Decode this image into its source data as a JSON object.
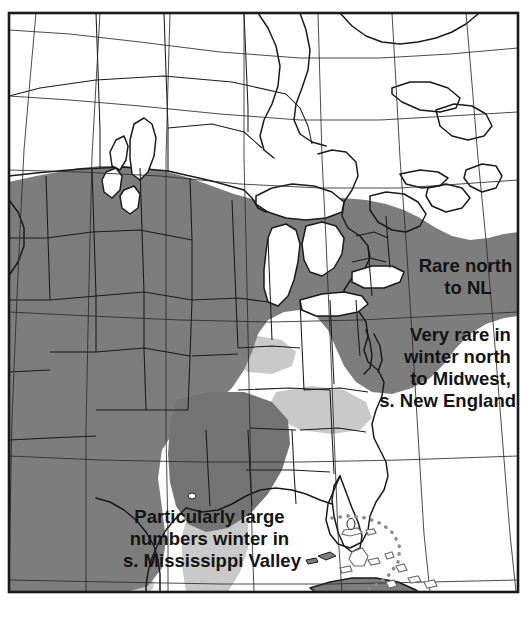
{
  "map": {
    "type": "species-winter-range-map",
    "frame": {
      "border_color": "#1a1a1a",
      "background_color": "#ffffff"
    },
    "legend_colors": {
      "core_range": "#7d7d7d",
      "secondary_range": "#8c8c8c",
      "peripheral_range": "#c9c9c9",
      "water": "#ffffff",
      "outline": "#1a1a1a",
      "text": "#141414"
    },
    "annotations": [
      {
        "id": "annotation-rare-north",
        "align": "middle",
        "x": 468,
        "y": 272,
        "lines": [
          "Rare north",
          "to NL"
        ]
      },
      {
        "id": "annotation-very-rare-winter",
        "align": "end",
        "x": 516,
        "y": 341,
        "lines": [
          "Very rare in",
          "winter north",
          "to Midwest,",
          "s. New England"
        ]
      },
      {
        "id": "annotation-mississippi-valley",
        "align": "middle",
        "x": 212,
        "y": 523,
        "lines": [
          "Particularly large",
          "numbers winter in",
          "s. Mississippi Valley"
        ]
      }
    ],
    "features": {
      "dotted_boundary_label": "bahamas-dotted-range-boundary",
      "graticule_label": "latitude-longitude-graticule",
      "great_lakes_label": "great-lakes",
      "lake_winnipeg_label": "lake-winnipeg"
    }
  }
}
